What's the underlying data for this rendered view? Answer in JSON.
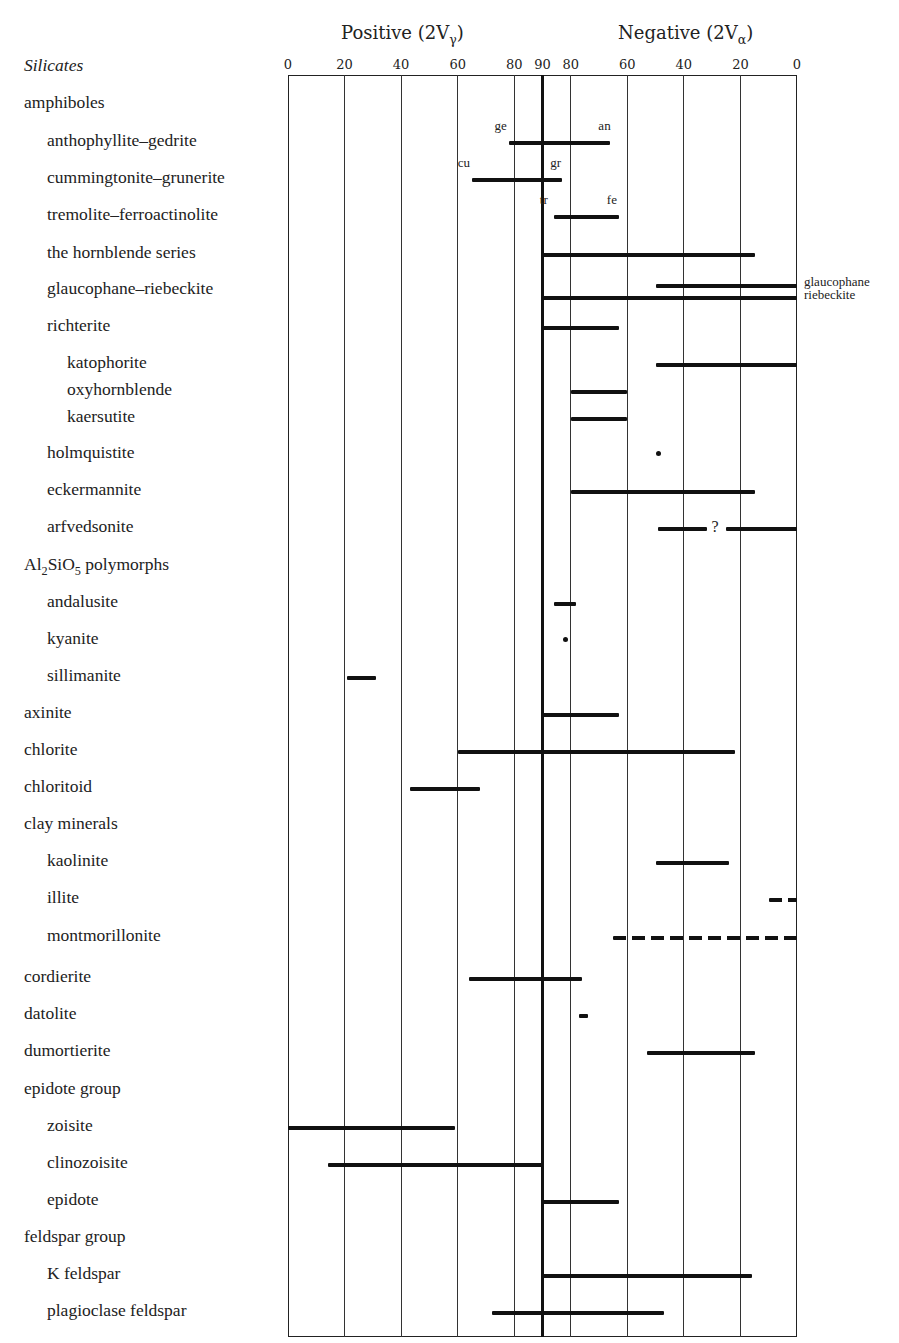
{
  "chart_data": {
    "type": "range-bar",
    "header_positive": "Positive (2Vγ)",
    "header_negative": "Negative (2Vα)",
    "row_header": "Silicates",
    "x_ticks": [
      "0",
      "20",
      "40",
      "60",
      "80",
      "90",
      "80",
      "60",
      "40",
      "20",
      "0"
    ],
    "x_scale_note": "Axis runs from +2V 0° (left) through 90° (center, thick line) to −2V 0° (right). Values below given as signed position: positive side 0–90 = 2Vγ, negative side uses 180 − 2Vα.",
    "rows": [
      {
        "label": "amphiboles",
        "indent": 0,
        "y": 102
      },
      {
        "label": "anthophyllite–gedrite",
        "indent": 1,
        "y": 140,
        "ranges": [
          [
            78,
            114
          ]
        ],
        "end_labels": {
          "left": "ge",
          "right": "an"
        }
      },
      {
        "label": "cummingtonite–grunerite",
        "indent": 1,
        "y": 177,
        "ranges": [
          [
            65,
            97
          ]
        ],
        "end_labels": {
          "left": "cu",
          "right": "gr"
        }
      },
      {
        "label": "tremolite–ferroactinolite",
        "indent": 1,
        "y": 214,
        "ranges": [
          [
            94,
            117
          ]
        ],
        "end_labels": {
          "left": "tr",
          "right": "fe"
        }
      },
      {
        "label": "the hornblende series",
        "indent": 1,
        "y": 252,
        "ranges": [
          [
            90,
            165
          ]
        ]
      },
      {
        "label": "glaucophane–riebeckite",
        "indent": 1,
        "y": 288,
        "ranges": [
          [
            130,
            180
          ],
          [
            90,
            180
          ]
        ],
        "side_labels": [
          "glaucophane",
          "riebeckite"
        ]
      },
      {
        "label": "richterite",
        "indent": 1,
        "y": 325,
        "ranges": [
          [
            90,
            117
          ]
        ]
      },
      {
        "label": "katophorite",
        "indent": 2,
        "y": 362,
        "ranges": [
          [
            130,
            180
          ]
        ]
      },
      {
        "label": "oxyhornblende",
        "indent": 2,
        "y": 389,
        "ranges": [
          [
            100,
            120
          ]
        ]
      },
      {
        "label": "kaersutite",
        "indent": 2,
        "y": 416,
        "ranges": [
          [
            100,
            120
          ]
        ]
      },
      {
        "label": "holmquistite",
        "indent": 1,
        "y": 452,
        "points": [
          131
        ]
      },
      {
        "label": "eckermannite",
        "indent": 1,
        "y": 489,
        "ranges": [
          [
            100,
            165
          ]
        ]
      },
      {
        "label": "arfvedsonite",
        "indent": 1,
        "y": 526,
        "ranges": [
          [
            131,
            148
          ],
          [
            155,
            180
          ]
        ],
        "annotation": "?"
      },
      {
        "label": "Al2SiO5 polymorphs",
        "indent": 0,
        "y": 564
      },
      {
        "label": "andalusite",
        "indent": 1,
        "y": 601,
        "ranges": [
          [
            94,
            102
          ]
        ]
      },
      {
        "label": "kyanite",
        "indent": 1,
        "y": 638,
        "points": [
          98
        ]
      },
      {
        "label": "sillimanite",
        "indent": 1,
        "y": 675,
        "ranges": [
          [
            21,
            31
          ]
        ]
      },
      {
        "label": "axinite",
        "indent": 0,
        "y": 712,
        "ranges": [
          [
            90,
            117
          ]
        ]
      },
      {
        "label": "chlorite",
        "indent": 0,
        "y": 749,
        "ranges": [
          [
            60,
            158
          ]
        ]
      },
      {
        "label": "chloritoid",
        "indent": 0,
        "y": 786,
        "ranges": [
          [
            43,
            68
          ]
        ]
      },
      {
        "label": "clay minerals",
        "indent": 0,
        "y": 823
      },
      {
        "label": "kaolinite",
        "indent": 1,
        "y": 860,
        "ranges": [
          [
            130,
            156
          ]
        ]
      },
      {
        "label": "illite",
        "indent": 1,
        "y": 897,
        "ranges": [
          [
            170,
            180
          ]
        ],
        "dashed": true
      },
      {
        "label": "montmorillonite",
        "indent": 1,
        "y": 935,
        "ranges": [
          [
            115,
            180
          ]
        ],
        "dashed": true
      },
      {
        "label": "cordierite",
        "indent": 0,
        "y": 976,
        "ranges": [
          [
            64,
            104
          ]
        ]
      },
      {
        "label": "datolite",
        "indent": 0,
        "y": 1013,
        "ranges": [
          [
            103,
            106
          ]
        ]
      },
      {
        "label": "dumortierite",
        "indent": 0,
        "y": 1050,
        "ranges": [
          [
            127,
            165
          ]
        ]
      },
      {
        "label": "epidote group",
        "indent": 0,
        "y": 1088
      },
      {
        "label": "zoisite",
        "indent": 1,
        "y": 1125,
        "ranges": [
          [
            0,
            59
          ]
        ]
      },
      {
        "label": "clinozoisite",
        "indent": 1,
        "y": 1162,
        "ranges": [
          [
            14,
            90
          ]
        ]
      },
      {
        "label": "epidote",
        "indent": 1,
        "y": 1199,
        "ranges": [
          [
            90,
            117
          ]
        ]
      },
      {
        "label": "feldspar group",
        "indent": 0,
        "y": 1236
      },
      {
        "label": "K feldspar",
        "indent": 1,
        "y": 1273,
        "ranges": [
          [
            90,
            164
          ]
        ]
      },
      {
        "label": "plagioclase feldspar",
        "indent": 1,
        "y": 1310,
        "ranges": [
          [
            72,
            133
          ]
        ]
      }
    ],
    "xlim": [
      0,
      180
    ],
    "grid": true
  },
  "labels": {
    "positive_header": "Positive (2V",
    "positive_sub": "γ",
    "negative_header": "Negative (2V",
    "negative_sub": "α",
    "row_header": "Silicates",
    "al2sio5_prefix": "Al",
    "al2sio5_sub1": "2",
    "al2sio5_mid": "SiO",
    "al2sio5_sub2": "5",
    "al2sio5_suffix": " polymorphs",
    "question": "?"
  }
}
